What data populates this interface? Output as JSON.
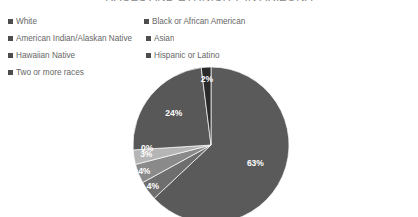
{
  "title": "RACES AND ETHNICITY IN ARIZONA",
  "legend": {
    "items": [
      {
        "label": "White",
        "color": "#4d4d4d"
      },
      {
        "label": "Black or African American",
        "color": "#4d4d4d"
      },
      {
        "label": "American Indian/Alaskan Native",
        "color": "#4d4d4d"
      },
      {
        "label": "Asian",
        "color": "#4d4d4d"
      },
      {
        "label": "Hawaiian Native",
        "color": "#4d4d4d"
      },
      {
        "label": "Hispanic or Latino",
        "color": "#4d4d4d"
      },
      {
        "label": "Two or more races",
        "color": "#4d4d4d"
      }
    ]
  },
  "chart_data": {
    "type": "pie",
    "title": "RACES AND ETHNICITY IN ARIZONA",
    "xlabel": "",
    "ylabel": "",
    "legend_position": "top",
    "grid": false,
    "categories": [
      "White",
      "Black or African American",
      "American Indian/Alaskan Native",
      "Asian",
      "Hawaiian Native",
      "Hispanic or Latino",
      "Two or more races"
    ],
    "values": [
      63,
      4,
      4,
      3,
      0,
      24,
      2
    ],
    "labels": [
      "63%",
      "4%",
      "4%",
      "3%",
      "0%",
      "24%",
      "2%"
    ],
    "colors": [
      "#5a5a5a",
      "#6e6e6e",
      "#8a8a8a",
      "#b5b5b5",
      "#cfcfcf",
      "#585858",
      "#2a2a2a"
    ],
    "start_angle_deg": 0,
    "direction": "clockwise",
    "center": {
      "x": 211,
      "y": 145
    },
    "radius": 78
  }
}
